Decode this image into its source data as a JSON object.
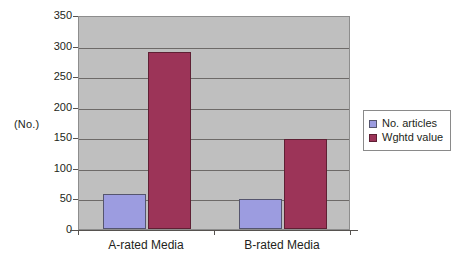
{
  "chart_data": {
    "type": "bar",
    "title": "",
    "subtitle": "",
    "xlabel": "",
    "ylabel": "(No.)",
    "categories": [
      "A-rated Media",
      "B-rated Media"
    ],
    "series": [
      {
        "name": "No. articles",
        "values": [
          58,
          49
        ],
        "color": "#9c9ce0"
      },
      {
        "name": "Wghtd value",
        "values": [
          290,
          147
        ],
        "color": "#9c3458"
      }
    ],
    "ylim": [
      0,
      350
    ],
    "ytick_step": 50,
    "yticks": [
      0,
      50,
      100,
      150,
      200,
      250,
      300,
      350
    ],
    "ytick_labels": [
      "0",
      "50",
      "100",
      "150",
      "200",
      "250",
      "300",
      "350"
    ],
    "grid": true,
    "grid_axis": "y",
    "legend": true,
    "legend_position": "right",
    "plot_background": "#bfbfbf",
    "figure_background": "#ffffff"
  },
  "legend": {
    "entries": [
      {
        "label": "No. articles"
      },
      {
        "label": "Wghtd value"
      }
    ]
  }
}
